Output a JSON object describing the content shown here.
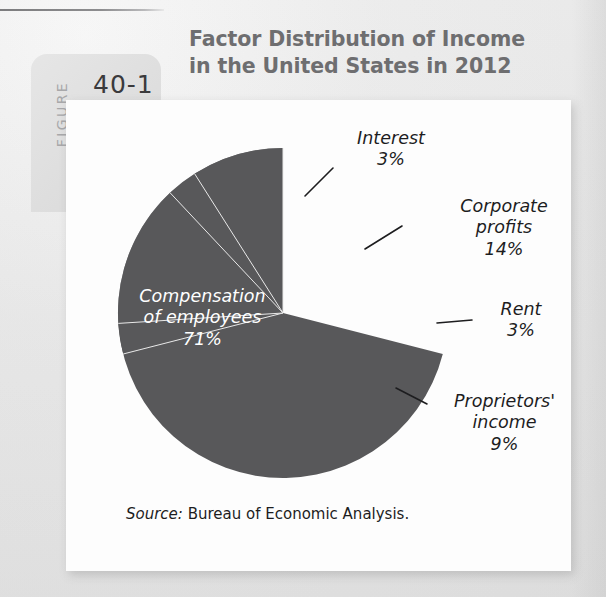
{
  "figure": {
    "label_word": "FIGURE",
    "number": "40-1"
  },
  "title": {
    "line1": "Factor Distribution of Income",
    "line2": "in the United States in 2012"
  },
  "source": {
    "prefix": "Source:",
    "text": " Bureau of Economic Analysis."
  },
  "colors": {
    "compensation": "#58585a",
    "interest": "#48484a",
    "corporate_profits": "#8a8a8c",
    "rent": "#c8c8c8",
    "proprietors_income": "#78787a",
    "title_gray": "#6e6e70",
    "tab_gray": "#e2e2e2",
    "panel_white": "#fdfdfd"
  },
  "labels": {
    "compensation": {
      "line1": "Compensation",
      "line2": "of employees",
      "line3": "71%"
    },
    "interest": {
      "line1": "Interest",
      "line2": "3%"
    },
    "corporate_profits": {
      "line1": "Corporate",
      "line2": "profits",
      "line3": "14%"
    },
    "rent": {
      "line1": "Rent",
      "line2": "3%"
    },
    "proprietors_income": {
      "line1": "Proprietors'",
      "line2": "income",
      "line3": "9%"
    }
  },
  "chart_data": {
    "type": "pie",
    "title": "Factor Distribution of Income in the United States in 2012",
    "xlabel": "",
    "ylabel": "",
    "legend_position": "callout-labels",
    "grid": false,
    "units": "percent",
    "total": 100,
    "categories": [
      "Compensation of employees",
      "Interest",
      "Corporate profits",
      "Rent",
      "Proprietors' income"
    ],
    "values": [
      71,
      3,
      14,
      3,
      9
    ],
    "slices": [
      {
        "name": "Compensation of employees",
        "value": 71,
        "label": "71%",
        "color": "#58585a",
        "label_placement": "inside"
      },
      {
        "name": "Interest",
        "value": 3,
        "label": "3%",
        "color": "#48484a",
        "label_placement": "callout"
      },
      {
        "name": "Corporate profits",
        "value": 14,
        "label": "14%",
        "color": "#8a8a8c",
        "label_placement": "callout"
      },
      {
        "name": "Rent",
        "value": 3,
        "label": "3%",
        "color": "#c8c8c8",
        "label_placement": "callout"
      },
      {
        "name": "Proprietors' income",
        "value": 9,
        "label": "9%",
        "color": "#78787a",
        "label_placement": "callout"
      }
    ],
    "source": "Source: Bureau of Economic Analysis."
  }
}
